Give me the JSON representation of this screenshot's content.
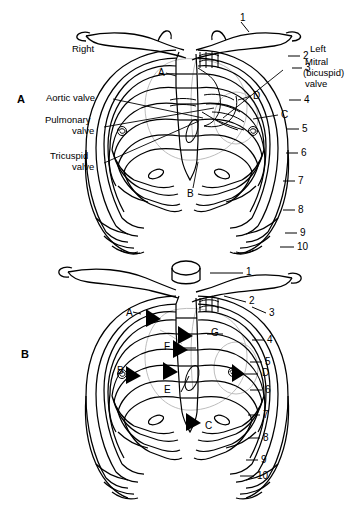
{
  "figure": {
    "background_color": "#ffffff",
    "line_color": "#000000",
    "faint_line_color": "#b9b9b9",
    "arrow_color": "#000000"
  },
  "panels": [
    {
      "id": "A",
      "letter": "A",
      "side_labels": [
        {
          "name": "right-side-label",
          "text": "Right"
        },
        {
          "name": "left-side-label",
          "text": "Left"
        }
      ],
      "valve_labels": [
        {
          "name": "aortic-valve-label",
          "text": "Aortic valve"
        },
        {
          "name": "pulmonary-valve-label",
          "text": "Pulmonary\nvalve"
        },
        {
          "name": "pulmonary-valve-line1",
          "text": "Pulmonary"
        },
        {
          "name": "pulmonary-valve-line2",
          "text": "valve"
        },
        {
          "name": "tricuspid-valve-line1",
          "text": "Tricuspid"
        },
        {
          "name": "tricuspid-valve-line2",
          "text": "valve"
        },
        {
          "name": "mitral-valve-line1",
          "text": "Mitral"
        },
        {
          "name": "mitral-valve-line2",
          "text": "(bicuspid)"
        },
        {
          "name": "mitral-valve-line3",
          "text": "valve"
        }
      ],
      "point_letters": [
        "A",
        "B",
        "C",
        "D"
      ],
      "rib_numbers": [
        "1",
        "2",
        "3",
        "4",
        "5",
        "6",
        "7",
        "8",
        "9",
        "10"
      ]
    },
    {
      "id": "B",
      "letter": "B",
      "point_letters": [
        "A",
        "B",
        "C",
        "D",
        "E",
        "F",
        "G"
      ],
      "rib_numbers": [
        "1",
        "2",
        "3",
        "4",
        "5",
        "6",
        "7",
        "8",
        "9",
        "10"
      ]
    }
  ],
  "panelA": {
    "letter": "A",
    "right": "Right",
    "left": "Left",
    "aortic": "Aortic valve",
    "pulmonary1": "Pulmonary",
    "pulmonary2": "valve",
    "tricuspid1": "Tricuspid",
    "tricuspid2": "valve",
    "mitral1": "Mitral",
    "mitral2": "(bicuspid)",
    "mitral3": "valve",
    "ptA": "A",
    "ptB": "B",
    "ptC": "C",
    "ptD": "D",
    "rib1": "1",
    "rib2": "2",
    "rib3": "3",
    "rib4": "4",
    "rib5": "5",
    "rib6": "6",
    "rib7": "7",
    "rib8": "8",
    "rib9": "9",
    "rib10": "10"
  },
  "panelB": {
    "letter": "B",
    "ptA": "A",
    "ptB": "B",
    "ptC": "C",
    "ptD": "D",
    "ptE": "E",
    "ptF": "F",
    "ptG": "G",
    "rib1": "1",
    "rib2": "2",
    "rib3": "3",
    "rib4": "4",
    "rib5": "5",
    "rib6": "6",
    "rib7": "7",
    "rib8": "8",
    "rib9": "9",
    "rib10": "10"
  }
}
